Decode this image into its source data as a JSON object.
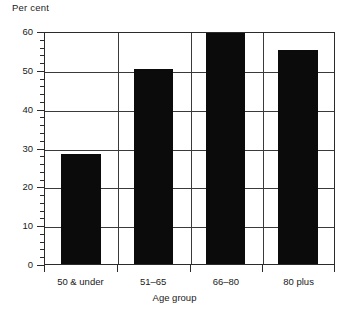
{
  "chart_data": {
    "type": "bar",
    "title": "",
    "categories": [
      "50 & under",
      "51–65",
      "66–80",
      "80 plus"
    ],
    "values": [
      28.5,
      50.7,
      60.0,
      55.6
    ],
    "series": [
      {
        "name": "Per cent",
        "values": [
          28.5,
          50.7,
          60.0,
          55.6
        ]
      }
    ],
    "xlabel": "Age group",
    "ylabel": "Per cent",
    "ylim": [
      0,
      60
    ],
    "xlim_categories": 4,
    "y_ticks": [
      0,
      10,
      20,
      30,
      40,
      50,
      60
    ],
    "y_tick_labels": [
      "0",
      "10",
      "20",
      "30",
      "40",
      "50",
      "60"
    ],
    "y_minor_tick_step": 2,
    "grid": "horizontal-and-vertical",
    "legend": "none",
    "bar_color": "#0b0b0b",
    "axis_color": "#2b2b2b",
    "grid_color": "#3a3a3a",
    "background_color": "#ffffff"
  },
  "axes": {
    "y_title": "Per cent",
    "x_title": "Age group"
  },
  "y_labels": [
    "60",
    "50",
    "40",
    "30",
    "20",
    "10",
    "0"
  ],
  "x_labels": [
    "50 & under",
    "51–65",
    "66–80",
    "80 plus"
  ]
}
